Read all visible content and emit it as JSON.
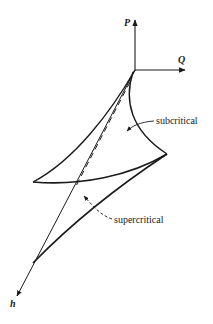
{
  "diagram": {
    "type": "cusp-catastrophe-surface",
    "axes": {
      "p": {
        "label": "P"
      },
      "q": {
        "label": "Q"
      },
      "h": {
        "label": "h"
      }
    },
    "regions": {
      "subcritical": {
        "label": "subcritical"
      },
      "supercritical": {
        "label": "supercritical"
      }
    },
    "colors": {
      "line": "#1a1a1a",
      "background": "#ffffff"
    }
  }
}
